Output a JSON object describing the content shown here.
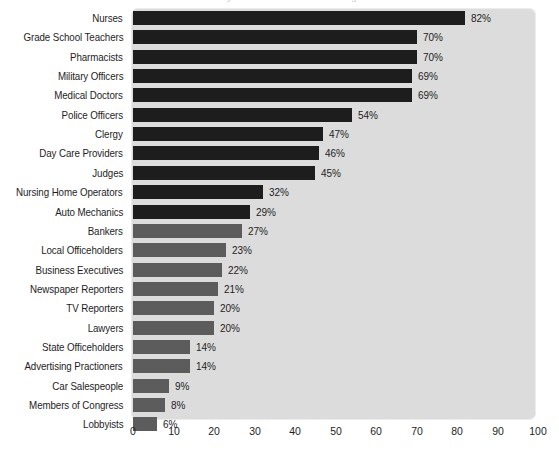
{
  "title": "Honesty and Ethical Standards Ratings",
  "chart_data": {
    "type": "bar",
    "orientation": "horizontal",
    "title": "Honesty and Ethical Standards Ratings",
    "xlabel": "",
    "ylabel": "",
    "xlim": [
      0,
      100
    ],
    "xticks": [
      0,
      10,
      20,
      30,
      40,
      50,
      60,
      70,
      80,
      90,
      100
    ],
    "grid": false,
    "legend": "none",
    "value_suffix": "%",
    "categories": [
      "Nurses",
      "Grade School Teachers",
      "Pharmacists",
      "Military Officers",
      "Medical Doctors",
      "Police Officers",
      "Clergy",
      "Day Care Providers",
      "Judges",
      "Nursing Home Operators",
      "Auto Mechanics",
      "Bankers",
      "Local Officeholders",
      "Business Executives",
      "Newspaper Reporters",
      "TV Reporters",
      "Lawyers",
      "State Officeholders",
      "Advertising Practioners",
      "Car Salespeople",
      "Members of Congress",
      "Lobbyists"
    ],
    "values": [
      82,
      70,
      70,
      69,
      69,
      54,
      47,
      46,
      45,
      32,
      29,
      27,
      23,
      22,
      21,
      20,
      20,
      14,
      14,
      9,
      8,
      6
    ],
    "value_labels": [
      "82%",
      "70%",
      "70%",
      "69%",
      "69%",
      "54%",
      "47%",
      "46%",
      "45%",
      "32%",
      "29%",
      "27%",
      "23%",
      "22%",
      "21%",
      "20%",
      "20%",
      "14%",
      "14%",
      "9%",
      "8%",
      "6%"
    ],
    "bar_colors": [
      "#1d1d1d",
      "#1d1d1d",
      "#1d1d1d",
      "#1d1d1d",
      "#1d1d1d",
      "#1d1d1d",
      "#1d1d1d",
      "#1d1d1d",
      "#1d1d1d",
      "#1d1d1d",
      "#1d1d1d",
      "#5c5c5c",
      "#5c5c5c",
      "#5c5c5c",
      "#5c5c5c",
      "#5c5c5c",
      "#5c5c5c",
      "#5c5c5c",
      "#5c5c5c",
      "#5c5c5c",
      "#5c5c5c",
      "#5c5c5c"
    ],
    "colors": {
      "dark_bar": "#1d1d1d",
      "light_bar": "#5c5c5c",
      "plot_background": "#dcdcdc",
      "page_background": "#ffffff",
      "text": "#1d1d1d"
    }
  }
}
